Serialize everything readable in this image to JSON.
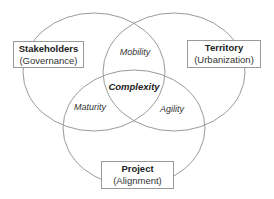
{
  "diagram": {
    "type": "venn",
    "stroke_color": "#9a9a9a",
    "sets": [
      {
        "title": "Stakeholders",
        "subtitle": "(Governance)"
      },
      {
        "title": "Territory",
        "subtitle": "(Urbanization)"
      },
      {
        "title": "Project",
        "subtitle": "(Alignment)"
      }
    ],
    "intersections": {
      "stakeholders_territory": "Mobility",
      "stakeholders_project": "Maturity",
      "territory_project": "Agility",
      "all": "Complexity"
    }
  }
}
